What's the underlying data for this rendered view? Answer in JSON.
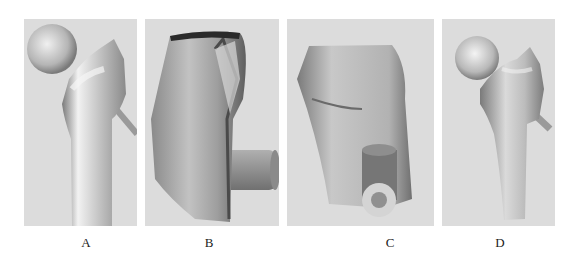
{
  "figure": {
    "panels": [
      {
        "id": "A",
        "label": "A",
        "subject": "proximal-femur-3d-model-anterior-view"
      },
      {
        "id": "B",
        "label": "B",
        "subject": "femur-segment-with-cylinder-side-view"
      },
      {
        "id": "C",
        "label": "C",
        "subject": "femur-segment-with-hollow-cylinder"
      },
      {
        "id": "D",
        "label": "D",
        "subject": "proximal-femur-3d-model-with-implant"
      }
    ],
    "colors": {
      "panel_background": "#dcdcdc",
      "bone_light": "#e6e6e6",
      "bone_mid": "#b8b8b8",
      "bone_dark": "#6e6e6e"
    }
  }
}
